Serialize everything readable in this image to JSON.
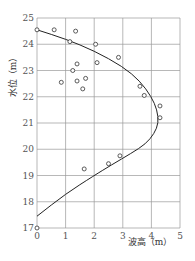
{
  "chart_data": {
    "type": "scatter",
    "title": "",
    "xlabel": "波高（m）",
    "ylabel": "水位（m）",
    "xlim": [
      0,
      5
    ],
    "ylim": [
      17,
      25
    ],
    "xticks": [
      "0",
      "1",
      "2",
      "3",
      "4",
      "5"
    ],
    "yticks": [
      "17",
      "18",
      "19",
      "20",
      "21",
      "22",
      "23",
      "24",
      "25"
    ],
    "grid": true,
    "series": [
      {
        "name": "observed",
        "marker": "open-circle",
        "points": [
          [
            0.0,
            24.55
          ],
          [
            0.6,
            24.55
          ],
          [
            1.35,
            24.5
          ],
          [
            1.15,
            24.1
          ],
          [
            2.05,
            24.0
          ],
          [
            2.85,
            23.5
          ],
          [
            1.4,
            23.25
          ],
          [
            2.1,
            23.3
          ],
          [
            1.25,
            23.0
          ],
          [
            0.85,
            22.55
          ],
          [
            1.4,
            22.6
          ],
          [
            1.7,
            22.7
          ],
          [
            1.6,
            22.3
          ],
          [
            3.6,
            22.4
          ],
          [
            3.75,
            22.05
          ],
          [
            4.3,
            21.65
          ],
          [
            4.3,
            21.2
          ],
          [
            1.65,
            19.25
          ],
          [
            2.5,
            19.45
          ],
          [
            2.9,
            19.75
          ],
          [
            0.0,
            17.0
          ]
        ]
      },
      {
        "name": "fitted curve",
        "marker": "line",
        "points": [
          [
            0.0,
            24.55
          ],
          [
            1.0,
            24.2
          ],
          [
            2.0,
            23.75
          ],
          [
            3.0,
            23.15
          ],
          [
            3.6,
            22.6
          ],
          [
            4.0,
            22.0
          ],
          [
            4.2,
            21.5
          ],
          [
            4.25,
            21.0
          ],
          [
            4.1,
            20.6
          ],
          [
            3.8,
            20.2
          ],
          [
            3.3,
            19.85
          ],
          [
            2.6,
            19.4
          ],
          [
            2.0,
            19.0
          ],
          [
            1.0,
            18.3
          ],
          [
            0.0,
            17.45
          ]
        ]
      }
    ]
  }
}
